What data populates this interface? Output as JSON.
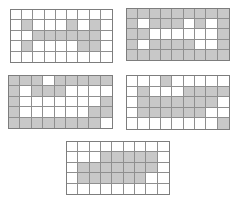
{
  "canvas": {
    "width": 236,
    "height": 213,
    "background": "#ffffff"
  },
  "colors": {
    "shaded_cell": "#c8c8c8",
    "empty_cell": "#ffffff",
    "grid_line": "#8f8f8f",
    "outer_border": "#7d7d7d"
  },
  "grid_meta": {
    "columns": 9,
    "rows": 5,
    "legend": "1 = shaded cell, 0 = white cell"
  },
  "grids": [
    {
      "name": "grid-top-left",
      "left": 10,
      "top": 9,
      "width": 103,
      "height": 54,
      "pattern": [
        "000000000",
        "010001010",
        "001111110",
        "010000110",
        "000000000"
      ],
      "shaded_count": 12
    },
    {
      "name": "grid-top-right",
      "left": 126,
      "top": 8,
      "width": 104,
      "height": 53,
      "pattern": [
        "111111111",
        "101110101",
        "110000001",
        "101111001",
        "111111111"
      ],
      "shaded_count": 33
    },
    {
      "name": "grid-middle-left",
      "left": 8,
      "top": 75,
      "width": 105,
      "height": 54,
      "pattern": [
        "111011111",
        "101110000",
        "100000001",
        "100000011",
        "111111110"
      ],
      "shaded_count": 25
    },
    {
      "name": "grid-middle-right",
      "left": 126,
      "top": 75,
      "width": 104,
      "height": 55,
      "pattern": [
        "000100000",
        "010001111",
        "011111110",
        "011111100",
        "000000001"
      ],
      "shaded_count": 20
    },
    {
      "name": "grid-bottom-center",
      "left": 66,
      "top": 141,
      "width": 104,
      "height": 54,
      "pattern": [
        "000000000",
        "000111110",
        "011111110",
        "011111100",
        "000000000"
      ],
      "shaded_count": 18
    }
  ]
}
